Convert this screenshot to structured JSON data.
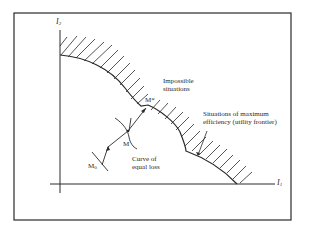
{
  "diagram": {
    "axes": {
      "y_label": "I",
      "y_label_sub": "2",
      "x_label": "I",
      "x_label_sub": "1"
    },
    "regions": {
      "impossible": [
        "Impossible",
        "situations"
      ]
    },
    "annotations": {
      "frontier": [
        "Situations of maximum",
        "efficiency (utility frontier)"
      ],
      "equal_loss": [
        "Curve of",
        "equal loss"
      ]
    },
    "points": {
      "m_star": "M*",
      "m": "M",
      "m0": "M",
      "m0_sub": "0"
    },
    "colors": {
      "line": "#2a2a2a",
      "background": "#ffffff"
    }
  }
}
